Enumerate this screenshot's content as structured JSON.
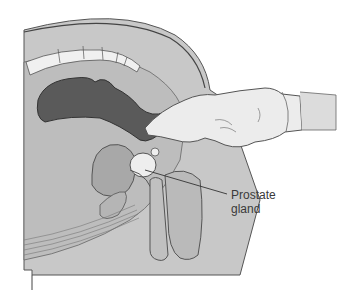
{
  "diagram": {
    "labels": [
      {
        "id": "prostate",
        "line1": "Prostate",
        "line2": "gland"
      }
    ],
    "colors": {
      "body": "#c8c8c8",
      "rectum": "#5a5a5a",
      "bladder": "#a8a8a8",
      "glove": "#ececec",
      "outline": "#555555",
      "spine": "#f0f0f0",
      "prostate": "#eeeeee"
    }
  }
}
